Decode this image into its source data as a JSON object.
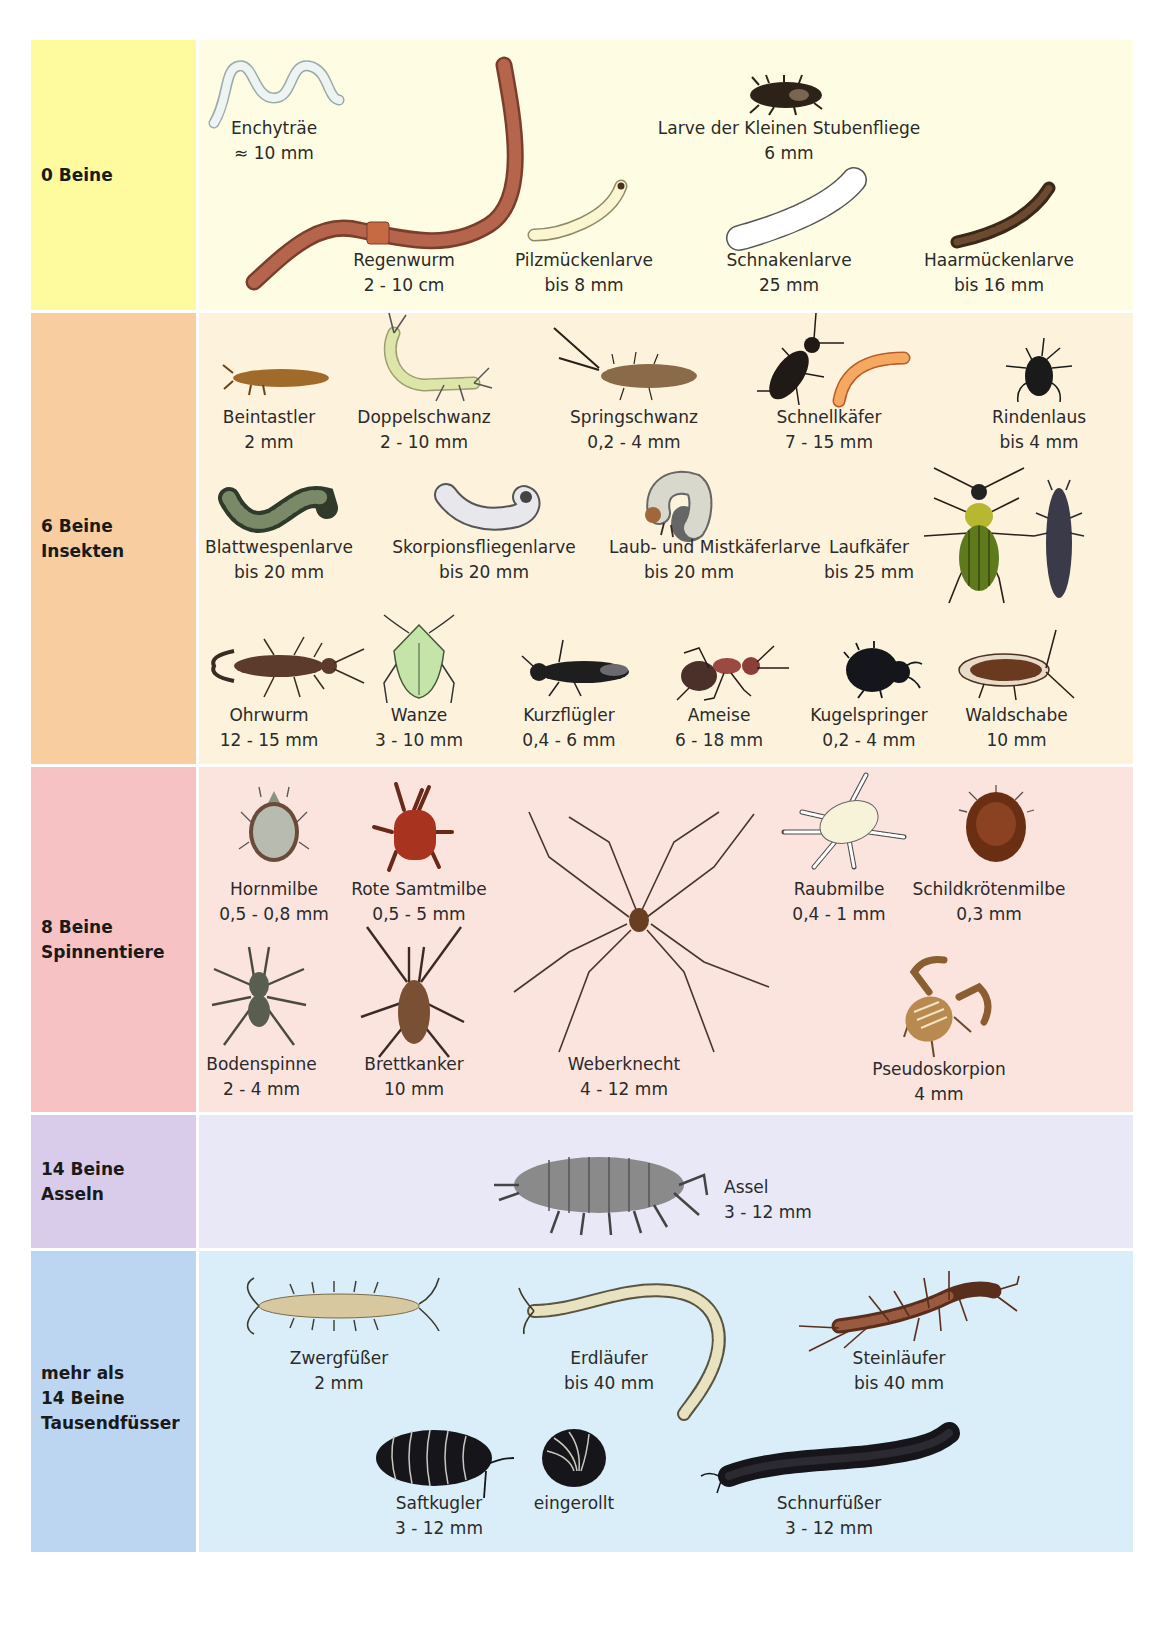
{
  "sections": [
    {
      "id": "0-beine",
      "label": "0 Beine",
      "colors": {
        "label_bg": "#fefb9f",
        "content_bg": "#fefde3"
      },
      "animals": [
        {
          "name": "Enchyträe",
          "size": "≈ 10 mm"
        },
        {
          "name": "Larve der Kleinen Stubenfliege",
          "size": "6 mm"
        },
        {
          "name": "Regenwurm",
          "size": "2 - 10 cm"
        },
        {
          "name": "Pilzmückenlarve",
          "size": "bis 8 mm"
        },
        {
          "name": "Schnakenlarve",
          "size": "25 mm"
        },
        {
          "name": "Haarmückenlarve",
          "size": "bis 16 mm"
        }
      ]
    },
    {
      "id": "6-beine",
      "label": "6 Beine\nInsekten",
      "colors": {
        "label_bg": "#f8cda0",
        "content_bg": "#fdf2dc"
      },
      "animals": [
        {
          "name": "Beintastler",
          "size": "2 mm"
        },
        {
          "name": "Doppelschwanz",
          "size": "2 - 10 mm"
        },
        {
          "name": "Springschwanz",
          "size": "0,2 - 4 mm"
        },
        {
          "name": "Schnellkäfer",
          "size": "7 - 15 mm"
        },
        {
          "name": "Rindenlaus",
          "size": "bis 4 mm"
        },
        {
          "name": "Blattwespenlarve",
          "size": "bis 20 mm"
        },
        {
          "name": "Skorpionsfliegenlarve",
          "size": "bis 20 mm"
        },
        {
          "name": "Laub- und\nMistkäferlarve",
          "size": "bis 20 mm"
        },
        {
          "name": "Laufkäfer",
          "size": "bis 25 mm"
        },
        {
          "name": "Ohrwurm",
          "size": "12 - 15 mm"
        },
        {
          "name": "Wanze",
          "size": "3 - 10 mm"
        },
        {
          "name": "Kurzflügler",
          "size": "0,4 - 6 mm"
        },
        {
          "name": "Ameise",
          "size": "6 - 18 mm"
        },
        {
          "name": "Kugelspringer",
          "size": "0,2 - 4 mm"
        },
        {
          "name": "Waldschabe",
          "size": "10 mm"
        }
      ]
    },
    {
      "id": "8-beine",
      "label": "8 Beine\nSpinnentiere",
      "colors": {
        "label_bg": "#f6c2c4",
        "content_bg": "#fbe3de"
      },
      "animals": [
        {
          "name": "Hornmilbe",
          "size": "0,5 - 0,8 mm"
        },
        {
          "name": "Rote Samtmilbe",
          "size": "0,5 - 5 mm"
        },
        {
          "name": "Raubmilbe",
          "size": "0,4 - 1 mm"
        },
        {
          "name": "Schildkrötenmilbe",
          "size": "0,3 mm"
        },
        {
          "name": "Bodenspinne",
          "size": "2 - 4 mm"
        },
        {
          "name": "Brettkanker",
          "size": "10 mm"
        },
        {
          "name": "Weberknecht",
          "size": "4 - 12 mm"
        },
        {
          "name": "Pseudoskorpion",
          "size": "4 mm"
        }
      ]
    },
    {
      "id": "14-beine",
      "label": "14 Beine\nAsseln",
      "colors": {
        "label_bg": "#d9ccea",
        "content_bg": "#e9e8f6"
      },
      "animals": [
        {
          "name": "Assel",
          "size": "3 - 12 mm"
        }
      ]
    },
    {
      "id": "mehr-als-14-beine",
      "label": "mehr als\n14 Beine\nTausendfüsser",
      "colors": {
        "label_bg": "#bcd6f1",
        "content_bg": "#d9eef8"
      },
      "animals": [
        {
          "name": "Zwergfüßer",
          "size": "2 mm"
        },
        {
          "name": "Erdläufer",
          "size": "bis 40 mm"
        },
        {
          "name": "Steinläufer",
          "size": "bis 40 mm"
        },
        {
          "name": "Saftkugler",
          "size": "3 - 12 mm"
        },
        {
          "name": "eingerollt",
          "size": ""
        },
        {
          "name": "Schnurfüßer",
          "size": "3 - 12 mm"
        }
      ]
    }
  ]
}
